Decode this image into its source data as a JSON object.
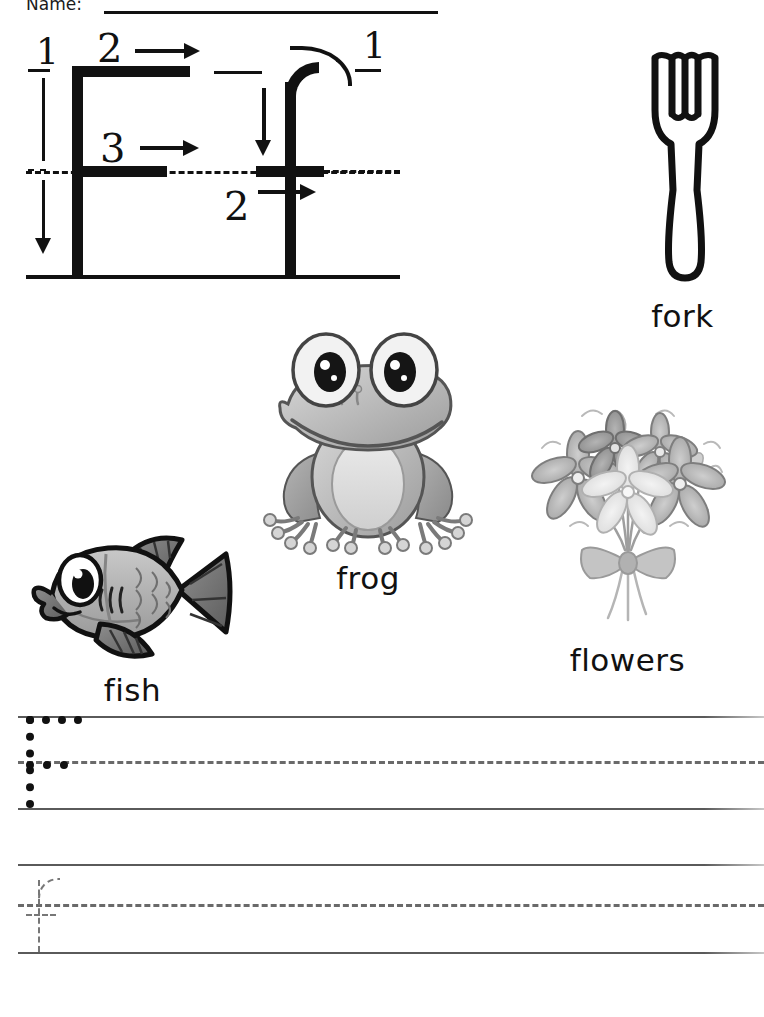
{
  "page": {
    "background_color": "#ffffff",
    "ink_color": "#111111",
    "rule_color": "#5a5a5a"
  },
  "header": {
    "name_label": "Name:",
    "name_line_value": ""
  },
  "formation": {
    "uppercase_letter": "F",
    "lowercase_letter": "f",
    "uppercase_stroke_numbers": [
      "1",
      "2",
      "3"
    ],
    "lowercase_stroke_numbers": [
      "1",
      "2"
    ],
    "stroke_notes": {
      "uppercase_1": "vertical stroke downward",
      "uppercase_2": "top horizontal stroke to the right",
      "uppercase_3": "middle horizontal stroke to the right",
      "lowercase_1": "curved hook over then down",
      "lowercase_2": "crossbar to the right"
    }
  },
  "pictures": [
    {
      "name": "fork",
      "label": "fork",
      "icon": "fork-icon"
    },
    {
      "name": "frog",
      "label": "frog",
      "icon": "frog-icon"
    },
    {
      "name": "fish",
      "label": "fish",
      "icon": "fish-icon"
    },
    {
      "name": "flowers",
      "label": "flowers",
      "icon": "flowers-icon"
    }
  ],
  "practice": {
    "rows": [
      {
        "letter": "F",
        "case": "uppercase",
        "guide": "dotted"
      },
      {
        "letter": "f",
        "case": "lowercase",
        "guide": "dashed"
      }
    ]
  }
}
